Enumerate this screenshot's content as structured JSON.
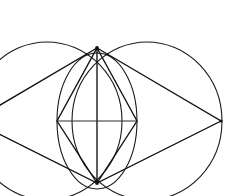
{
  "figure": {
    "background_color": "#ffffff",
    "stroke_color": "#1a1a1a",
    "canvas": {
      "width": 244,
      "height": 196
    },
    "points": {
      "top_vertex": {
        "x": 97,
        "y": 48,
        "label": "Top"
      },
      "bottom_vertex": {
        "x": 97,
        "y": 183,
        "label": "Bottom"
      },
      "right_vertex": {
        "x": 221,
        "y": 121,
        "label": "Right"
      },
      "left_vertex": {
        "x": -27,
        "y": 121,
        "label": "Left"
      },
      "center": {
        "x": 97,
        "y": 121,
        "label": "Center"
      },
      "inner_left": {
        "x": 57,
        "y": 121,
        "label": "Inner left"
      },
      "inner_right": {
        "x": 137,
        "y": 121,
        "label": "Inner right"
      }
    },
    "ellipses": [
      {
        "name": "left-large-ellipse",
        "cx": 47,
        "cy": 121,
        "rx": 75,
        "ry": 79
      },
      {
        "name": "right-large-ellipse",
        "cx": 147,
        "cy": 121,
        "rx": 75,
        "ry": 79
      },
      {
        "name": "inner-ellipse",
        "cx": 97,
        "cy": 121,
        "rx": 40,
        "ry": 68
      }
    ],
    "polygons": [
      {
        "name": "outer-rhombus",
        "vertices": "97,48 221,121 97,183 -27,121"
      },
      {
        "name": "inner-rhombus",
        "vertices": "97,48 137,121 97,183 57,121"
      }
    ],
    "lines": [
      {
        "name": "vertical-axis",
        "x1": 97,
        "y1": 48,
        "x2": 97,
        "y2": 183
      },
      {
        "name": "horizontal-axis",
        "x1": 57,
        "y1": 121,
        "x2": 137,
        "y2": 121
      }
    ],
    "colors": {
      "ink": "#1a1a1a",
      "paper": "#ffffff"
    }
  }
}
